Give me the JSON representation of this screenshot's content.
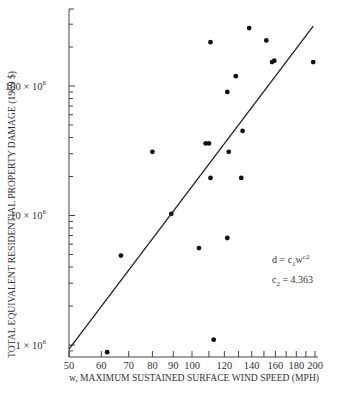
{
  "chart_data": {
    "type": "scatter",
    "title": "",
    "xlabel": "w, MAXIMUM SUSTAINED SURFACE WIND SPEED (MPH)",
    "ylabel": "TOTAL EQUIVALENT RESIDENTIAL PROPERTY DAMAGE (1969 $)",
    "xscale": "log",
    "yscale": "log",
    "xlim": [
      50,
      200
    ],
    "ylim": [
      800000,
      400000000
    ],
    "x_ticks": [
      50,
      60,
      70,
      80,
      90,
      100,
      110,
      120,
      130,
      140,
      150,
      160,
      170,
      180,
      190,
      200
    ],
    "x_tick_labels": [
      "50",
      "60",
      "70",
      "80",
      "90",
      "100",
      "120",
      "140",
      "160",
      "180",
      "200"
    ],
    "y_tick_labels": [
      "1 × 10^6",
      "10 × 10^6",
      "100 × 10^6"
    ],
    "y_tick_values": [
      1000000,
      10000000,
      100000000
    ],
    "grid": false,
    "series": [
      {
        "name": "observed hurricanes",
        "marker": "filled-circle",
        "points": [
          {
            "w": 62,
            "d": 880000
          },
          {
            "w": 67,
            "d": 4900000
          },
          {
            "w": 80,
            "d": 31000000
          },
          {
            "w": 89,
            "d": 10300000
          },
          {
            "w": 104,
            "d": 5600000
          },
          {
            "w": 108,
            "d": 36000000
          },
          {
            "w": 110,
            "d": 36000000
          },
          {
            "w": 111,
            "d": 218000000
          },
          {
            "w": 111,
            "d": 19500000
          },
          {
            "w": 113,
            "d": 1100000
          },
          {
            "w": 122,
            "d": 90000000
          },
          {
            "w": 122,
            "d": 6700000
          },
          {
            "w": 123,
            "d": 31000000
          },
          {
            "w": 128,
            "d": 119000000
          },
          {
            "w": 132,
            "d": 19500000
          },
          {
            "w": 133,
            "d": 45000000
          },
          {
            "w": 138,
            "d": 280000000
          },
          {
            "w": 152,
            "d": 225000000
          },
          {
            "w": 157,
            "d": 153000000
          },
          {
            "w": 159,
            "d": 157000000
          },
          {
            "w": 198,
            "d": 153000000
          }
        ]
      },
      {
        "name": "power-law fit",
        "type": "line",
        "equation": "d = c1 w^c2",
        "c2": 4.363,
        "endpoints": [
          {
            "w": 50,
            "d": 930000
          },
          {
            "w": 198,
            "d": 290000000
          }
        ]
      }
    ],
    "annotations": [
      "d = c1 w^c2",
      "c2 = 4.363"
    ]
  },
  "labels": {
    "xlabel": "w, MAXIMUM SUSTAINED SURFACE WIND SPEED (MPH)",
    "ylabel": "TOTAL EQUIVALENT RESIDENTIAL PROPERTY DAMAGE (1969 $)",
    "ytick_1": "1 × 10",
    "ytick_10": "10 × 10",
    "ytick_100": "100 × 10",
    "ytick_exp": "6",
    "xticks": [
      "50",
      "60",
      "70",
      "80",
      "90",
      "100",
      "120",
      "140",
      "160",
      "180",
      "200"
    ],
    "eq_d": "d = c",
    "eq_sub1": "1",
    "eq_w": "w",
    "eq_sup": "c2",
    "c2_c": "c",
    "c2_sub": "2",
    "c2_val": " = 4.363"
  }
}
